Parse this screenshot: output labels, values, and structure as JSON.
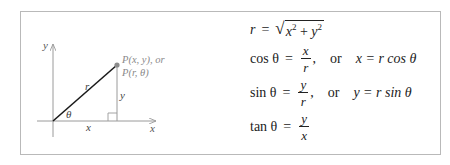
{
  "diagram": {
    "axis_y_label": "y",
    "axis_x_label": "x",
    "hypotenuse_label": "r",
    "vertical_leg_label": "y",
    "horizontal_leg_label": "x",
    "angle_label": "θ",
    "point_label_line1": "P(x, y), or",
    "point_label_line2": "P(r, θ)",
    "colors": {
      "axis": "#9a9a9a",
      "hypotenuse": "#1a1a1a",
      "point": "#8c8c8c",
      "border": "#b9b9b9"
    }
  },
  "formulas": {
    "r_def": {
      "lhs": "r",
      "eq": "=",
      "radicand_x": "x",
      "exp_x": "2",
      "plus": "+",
      "radicand_y": "y",
      "exp_y": "2"
    },
    "cos": {
      "lhs": "cos θ",
      "eq": "=",
      "num": "x",
      "den": "r",
      "comma": ",",
      "or": "or",
      "alt": "x = r cos θ"
    },
    "sin": {
      "lhs": "sin θ",
      "eq": "=",
      "num": "y",
      "den": "r",
      "comma": ",",
      "or": "or",
      "alt": "y = r sin θ"
    },
    "tan": {
      "lhs": "tan θ",
      "eq": "=",
      "num": "y",
      "den": "x"
    }
  }
}
